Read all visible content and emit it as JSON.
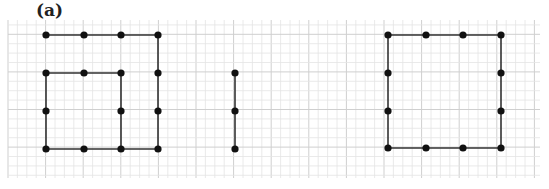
{
  "label": "(a)",
  "grid": {
    "x0": 8,
    "y0": 20,
    "x1": 540,
    "y1": 178,
    "minor": 9.4,
    "major_every": 4,
    "minor_color": "#e4e4e4",
    "major_color": "#cfcfcf"
  },
  "style": {
    "line_color": "#333333",
    "point_color": "#111111",
    "point_radius": 3.6
  },
  "figures": [
    {
      "name": "spiral-shape",
      "polyline": [
        [
          121,
          73
        ],
        [
          46,
          73
        ],
        [
          46,
          149
        ],
        [
          158,
          149
        ],
        [
          158,
          35
        ],
        [
          46,
          35
        ]
      ],
      "points": [
        [
          46,
          35
        ],
        [
          84,
          35
        ],
        [
          121,
          35
        ],
        [
          158,
          35
        ],
        [
          46,
          73
        ],
        [
          84,
          73
        ],
        [
          121,
          73
        ],
        [
          158,
          73
        ],
        [
          46,
          111
        ],
        [
          121,
          111
        ],
        [
          158,
          111
        ],
        [
          46,
          149
        ],
        [
          84,
          149
        ],
        [
          121,
          149
        ],
        [
          158,
          149
        ]
      ],
      "extra_segments": [
        [
          [
            121,
            73
          ],
          [
            121,
            149
          ]
        ]
      ]
    },
    {
      "name": "vertical-segment",
      "polyline": [
        [
          235,
          73
        ],
        [
          235,
          149
        ]
      ],
      "points": [
        [
          235,
          73
        ],
        [
          235,
          111
        ],
        [
          235,
          149
        ]
      ],
      "extra_segments": []
    },
    {
      "name": "square-shape",
      "polyline": [
        [
          388,
          35
        ],
        [
          501,
          35
        ],
        [
          501,
          148
        ],
        [
          388,
          148
        ],
        [
          388,
          35
        ]
      ],
      "points": [
        [
          388,
          35
        ],
        [
          426,
          35
        ],
        [
          463,
          35
        ],
        [
          501,
          35
        ],
        [
          388,
          73
        ],
        [
          501,
          73
        ],
        [
          388,
          111
        ],
        [
          501,
          111
        ],
        [
          388,
          148
        ],
        [
          426,
          148
        ],
        [
          463,
          148
        ],
        [
          501,
          148
        ]
      ],
      "extra_segments": []
    }
  ]
}
